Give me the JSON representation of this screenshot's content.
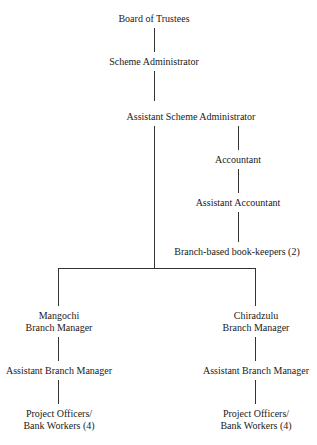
{
  "chart": {
    "type": "org-chart",
    "nodes": {
      "board": "Board of Trustees",
      "scheme_admin": "Scheme Administrator",
      "asst_scheme_admin": "Assistant Scheme Administrator",
      "accountant": "Accountant",
      "asst_accountant": "Assistant Accountant",
      "bookkeepers": "Branch-based book-keepers (2)",
      "mangochi_l1": "Mangochi",
      "mangochi_l2": "Branch Manager",
      "mangochi_asst": "Assistant Branch Manager",
      "mangochi_po_l1": "Project Officers/",
      "mangochi_po_l2": "Bank Workers (4)",
      "chiradzulu_l1": "Chiradzulu",
      "chiradzulu_l2": "Branch Manager",
      "chiradzulu_asst": "Assistant Branch Manager",
      "chiradzulu_po_l1": "Project Officers/",
      "chiradzulu_po_l2": "Bank Workers (4)"
    }
  }
}
